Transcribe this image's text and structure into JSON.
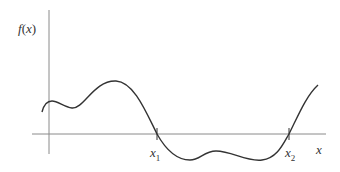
{
  "diagram": {
    "y_axis_label_f": "f",
    "y_axis_label_open": "(",
    "y_axis_label_var": "x",
    "y_axis_label_close": ")",
    "x_axis_label": "x",
    "roots": [
      {
        "base": "x",
        "sub": "1"
      },
      {
        "base": "x",
        "sub": "2"
      }
    ],
    "colors": {
      "axis": "#8a8a8a",
      "curve": "#333333",
      "text": "#333333"
    }
  }
}
